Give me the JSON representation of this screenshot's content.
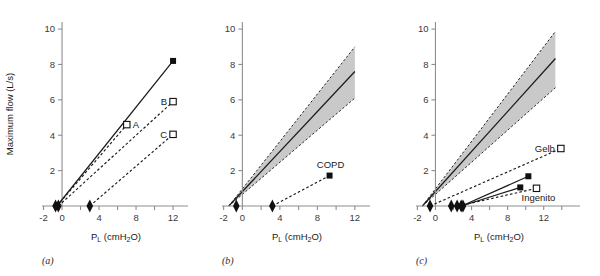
{
  "figure": {
    "axis_titles": {
      "y": "Maximum flow (L/s)",
      "x_main": "P",
      "x_sub_L": "L",
      "x_rest_open": " (cmH",
      "x_sub_2": "2",
      "x_rest_close": "O)"
    },
    "colors": {
      "band_fill": "#c9c9c9",
      "line": "#101010",
      "axis": "#8e8e8e",
      "text": "#1a1a1a"
    }
  },
  "chart_data": [
    {
      "id": "panel-a",
      "type": "line",
      "title": "",
      "panel_label": "(a)",
      "xlabel": "PL (cmH2O)",
      "ylabel": "Maximum flow (L/s)",
      "xlim": [
        -2.6,
        13.4
      ],
      "ylim": [
        0,
        10.4
      ],
      "xticks": [
        -2,
        0,
        4,
        8,
        12
      ],
      "xticks_minor": [
        2,
        6,
        10
      ],
      "yticks": [
        2,
        4,
        6,
        8,
        10
      ],
      "grid": false,
      "legend": "none",
      "series": [
        {
          "name": "Normal",
          "style": "solid",
          "x": [
            -0.55,
            12.0
          ],
          "y": [
            0,
            8.2
          ],
          "endpoint_marker": "filled-square"
        },
        {
          "name": "A",
          "style": "dashed",
          "label": "A",
          "x": [
            -0.55,
            7.0
          ],
          "y": [
            0,
            4.6
          ],
          "endpoint_marker": "open-square"
        },
        {
          "name": "B",
          "style": "dashed",
          "label": "B",
          "x": [
            -0.4,
            12.0
          ],
          "y": [
            0,
            5.9
          ],
          "endpoint_marker": "open-square"
        },
        {
          "name": "C",
          "style": "dashed",
          "label": "C",
          "x": [
            3.0,
            12.0
          ],
          "y": [
            0,
            4.05
          ],
          "endpoint_marker": "open-square"
        }
      ],
      "diamonds": [
        -0.7,
        -0.4,
        3.0
      ]
    },
    {
      "id": "panel-b",
      "type": "line",
      "panel_label": "(b)",
      "xlabel": "PL (cmH2O)",
      "xlim": [
        -2.6,
        13.4
      ],
      "ylim": [
        0,
        10.4
      ],
      "xticks": [
        -2,
        0,
        4,
        8,
        12
      ],
      "xticks_minor": [
        2,
        6,
        10
      ],
      "yticks": [
        2,
        4,
        6,
        8,
        10
      ],
      "grid": false,
      "band": {
        "name": "Normal range",
        "x_intercept": -1.45,
        "upper_at_x12": 9.0,
        "lower_at_x12": 6.1,
        "center_at_x12": 7.6
      },
      "series": [
        {
          "name": "COPD",
          "style": "dashed",
          "label": "COPD",
          "x": [
            3.2,
            9.3
          ],
          "y": [
            0,
            1.72
          ],
          "endpoint_marker": "filled-square"
        }
      ],
      "diamonds": [
        -0.65,
        3.2
      ]
    },
    {
      "id": "panel-c",
      "type": "line",
      "panel_label": "(c)",
      "xlabel": "PL (cmH2O)",
      "xlim": [
        -2.6,
        15.8
      ],
      "ylim": [
        0,
        10.4
      ],
      "xticks": [
        -2,
        0,
        4,
        8,
        12
      ],
      "xticks_minor": [
        2,
        6,
        10,
        14
      ],
      "yticks": [
        2,
        4,
        6,
        8,
        10
      ],
      "grid": false,
      "band": {
        "name": "Normal range",
        "x_intercept": -1.45,
        "upper_at_x12": 9.0,
        "lower_at_x12": 6.1,
        "center_at_x12": 7.6
      },
      "series": [
        {
          "name": "Gelb",
          "style": "dashed",
          "label": "Gelb",
          "x": [
            -0.6,
            13.9
          ],
          "y": [
            0,
            3.25
          ],
          "endpoint_marker": "open-square"
        },
        {
          "name": "Gelb-post",
          "style": "solid",
          "x": [
            2.9,
            10.3
          ],
          "y": [
            0,
            1.68
          ],
          "endpoint_marker": "filled-square"
        },
        {
          "name": "Ingenito",
          "style": "dashed",
          "label": "Ingenito",
          "x": [
            2.55,
            11.2
          ],
          "y": [
            0,
            1.0
          ],
          "endpoint_marker": "open-square"
        },
        {
          "name": "Ingenito-post",
          "style": "solid",
          "x": [
            2.9,
            9.4
          ],
          "y": [
            0,
            1.05
          ],
          "endpoint_marker": "filled-square"
        }
      ],
      "diamonds": [
        -0.6,
        1.75,
        2.4,
        2.85,
        3.05
      ]
    }
  ]
}
